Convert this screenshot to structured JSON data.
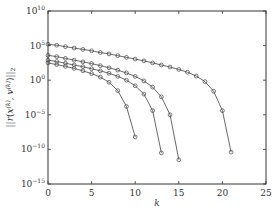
{
  "chart_data": {
    "type": "line",
    "title": "",
    "xlabel": "k",
    "ylabel": "||r(x^(k), v^(k))||_2",
    "xscale": "linear",
    "yscale": "log",
    "xlim": [
      0,
      25
    ],
    "ylim_exponents": [
      -15,
      10
    ],
    "xticks": [
      0,
      5,
      10,
      15,
      20,
      25
    ],
    "yticks_exponents": [
      -15,
      -10,
      -5,
      0,
      5,
      10
    ],
    "ytick_labels": [
      "10^-15",
      "10^-10",
      "10^-5",
      "10^0",
      "10^5",
      "10^10"
    ],
    "grid": false,
    "legend": null,
    "marker": "circle-open",
    "line_color": "#444444",
    "series": [
      {
        "name": "series-1",
        "x": [
          0,
          1,
          2,
          3,
          4,
          5,
          6,
          7,
          8,
          9,
          10,
          11,
          12,
          13,
          14,
          15,
          16,
          17,
          18,
          19,
          20,
          21
        ],
        "log10_y": [
          5.2,
          5.05,
          4.85,
          4.65,
          4.45,
          4.25,
          4.0,
          3.8,
          3.55,
          3.3,
          3.05,
          2.8,
          2.5,
          2.2,
          1.9,
          1.55,
          1.15,
          0.6,
          -0.2,
          -1.6,
          -4.4,
          -10.4
        ]
      },
      {
        "name": "series-2",
        "x": [
          0,
          1,
          2,
          3,
          4,
          5,
          6,
          7,
          8,
          9,
          10,
          11,
          12,
          13,
          14,
          15
        ],
        "log10_y": [
          3.6,
          3.4,
          3.15,
          2.9,
          2.65,
          2.4,
          2.1,
          1.8,
          1.45,
          1.05,
          0.55,
          -0.1,
          -1.0,
          -2.4,
          -5.0,
          -11.5
        ]
      },
      {
        "name": "series-3",
        "x": [
          0,
          1,
          2,
          3,
          4,
          5,
          6,
          7,
          8,
          9,
          10,
          11,
          12,
          13
        ],
        "log10_y": [
          2.9,
          2.7,
          2.45,
          2.2,
          1.95,
          1.65,
          1.35,
          1.0,
          0.55,
          0.0,
          -0.8,
          -2.0,
          -4.4,
          -10.5
        ]
      },
      {
        "name": "series-4",
        "x": [
          0,
          1,
          2,
          3,
          4,
          5,
          6,
          7,
          8,
          9,
          10
        ],
        "log10_y": [
          2.5,
          2.25,
          2.0,
          1.7,
          1.35,
          0.95,
          0.45,
          -0.3,
          -1.5,
          -3.8,
          -8.2
        ]
      }
    ]
  }
}
